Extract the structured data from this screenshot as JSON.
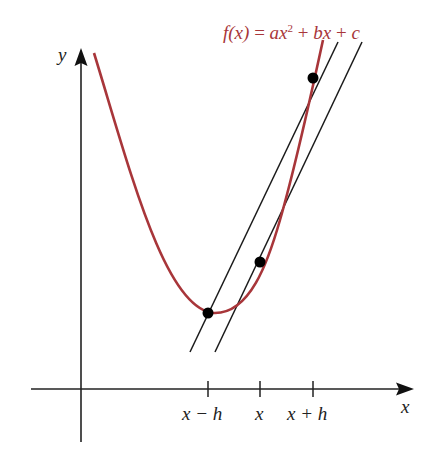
{
  "figure": {
    "function_label": {
      "prefix": "f(x)",
      "equals": "=",
      "term1": "ax",
      "term1_exp": "2",
      "plus1": "+",
      "term2": "bx",
      "plus2": "+",
      "term3": "c",
      "color": "#A8363A"
    },
    "axes": {
      "x_label": "x",
      "y_label": "y",
      "color": "#222222"
    },
    "ticks": [
      {
        "label": "x − h"
      },
      {
        "label": "x"
      },
      {
        "label": "x + h"
      }
    ],
    "curve_color": "#A8363A",
    "line_color": "#1a1a1a",
    "points": [
      {
        "name": "point-x-minus-h"
      },
      {
        "name": "point-x"
      },
      {
        "name": "point-x-plus-h"
      }
    ],
    "lines": [
      {
        "name": "secant-line"
      },
      {
        "name": "tangent-line"
      }
    ]
  }
}
